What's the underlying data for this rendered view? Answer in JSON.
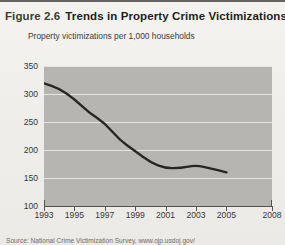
{
  "figure": {
    "number": "Figure 2.6",
    "title": "Trends in Property Crime Victimizations",
    "source": "Source: National Crime Victimization Survey, www.ojp.usdoj.gov/"
  },
  "chart_data": {
    "type": "line",
    "title": "Trends in Property Crime Victimizations",
    "xlabel": "",
    "ylabel": "Property victimizations per 1,000 households",
    "xlim": [
      1993,
      2008
    ],
    "ylim": [
      100,
      350
    ],
    "grid": true,
    "legend": null,
    "x": [
      1993,
      1994,
      1995,
      1996,
      1997,
      1998,
      1999,
      2000,
      2001,
      2002,
      2003,
      2004,
      2005
    ],
    "values": [
      319,
      310,
      291,
      266,
      248,
      217,
      198,
      178,
      167,
      168,
      173,
      167,
      160
    ],
    "yticks": [
      100,
      150,
      200,
      250,
      300,
      350
    ],
    "xticks": [
      1993,
      1995,
      1997,
      1999,
      2001,
      2003,
      2005,
      2008
    ],
    "series": [
      {
        "name": "Property victimizations per 1,000 households",
        "values": [
          319,
          310,
          291,
          266,
          248,
          217,
          198,
          178,
          167,
          168,
          173,
          167,
          160
        ]
      }
    ],
    "line_color": "#262625",
    "plot_background": "#b6b5b2",
    "gridline_color": "#eceae6"
  }
}
